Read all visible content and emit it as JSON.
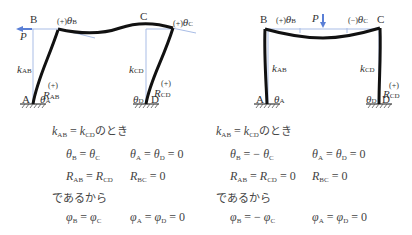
{
  "diagrams": [
    {
      "id": "sway-frame",
      "load": "P (horizontal, at B)",
      "labels": {
        "nodes": [
          "A",
          "B",
          "C",
          "D"
        ],
        "load": "P",
        "theta_B": "(+)θB",
        "theta_C": "(+)θC",
        "theta_A": "θA",
        "theta_D": "θD",
        "k_AB": "kAB",
        "k_CD": "kCD",
        "R_AB": "(+) RAB",
        "R_CD": "(+) RCD"
      },
      "equations": {
        "condition": "kAB = kCD のとき",
        "line1a": "θB = θC",
        "line1b": "θA = θD = 0",
        "line2a": "RAB = RCD",
        "line2b": "RBC = 0",
        "therefore": "であるから",
        "line3a": "φB = φC",
        "line3b": "φA = φD = 0",
        "line4a": "ψAB = ψCD",
        "line4b": "ψBC = 0"
      }
    },
    {
      "id": "symmetric-frame",
      "load": "P (vertical, midspan BC)",
      "labels": {
        "nodes": [
          "A",
          "B",
          "C",
          "D"
        ],
        "load": "P",
        "theta_B": "(+)θB",
        "theta_C": "(−)θC",
        "theta_A": "θA",
        "theta_D": "θD",
        "k_AB": "kAB",
        "k_CD": "kCD",
        "R_CD": "(+) RCD"
      },
      "equations": {
        "condition": "kAB = kCD のとき",
        "line1a": "θB = − θC",
        "line1b": "θA = θD = 0",
        "line2a": "RAB = RCD = 0",
        "line2b": "RBC = 0",
        "therefore": "であるから",
        "line3a": "φB = − φC",
        "line3b": "φA = φD = 0",
        "line4a": "ψAB = ψCD = 0",
        "line4b": "ψBC = 0"
      }
    }
  ],
  "colors": {
    "member": "#111111",
    "reference": "#9fb4e0",
    "load_arrow": "#5a7fd6",
    "text": "#333333"
  }
}
